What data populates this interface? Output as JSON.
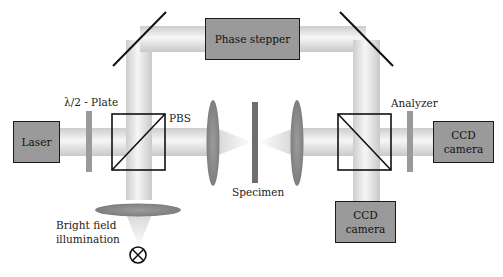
{
  "diagram": {
    "type": "optical-setup",
    "components": {
      "laser": {
        "label": "Laser"
      },
      "half_wave_plate": {
        "label": "λ/2 - Plate"
      },
      "pbs": {
        "label": "PBS"
      },
      "phase_stepper": {
        "label": "Phase stepper"
      },
      "specimen": {
        "label": "Specimen"
      },
      "analyzer": {
        "label": "Analyzer"
      },
      "ccd_right": {
        "line1": "CCD",
        "line2": "camera"
      },
      "ccd_bottom": {
        "line1": "CCD",
        "line2": "camera"
      },
      "bright_field": {
        "line1": "Bright field",
        "line2": "illumination"
      },
      "lamp": {
        "icon": "lamp-cross-circle-icon"
      }
    },
    "colors": {
      "box_fill": "#9a9a9a",
      "box_stroke": "#1a1a1a",
      "beam_edge": "#cfcfcf",
      "beam_center": "#f4f4f4",
      "optic_gray": "#8a8a8a",
      "line": "#111111"
    }
  }
}
